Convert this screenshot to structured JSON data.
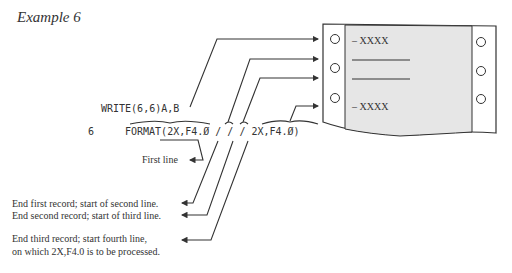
{
  "title": "Example 6",
  "code": {
    "write_stmt": "WRITE(6,6)A,B",
    "label": "6",
    "format_stmt": "FORMAT(2X,F4.Ø / / / 2X,F4.Ø)"
  },
  "paper": {
    "row1": "– XXXX",
    "row4": "– XXXX"
  },
  "annotations": {
    "first_line": "First line",
    "end_first": "End first record; start of second line.",
    "end_second": "End second record; start of third line.",
    "end_third_1": "End third record; start fourth line,",
    "end_third_2": "on which 2X,F4.0 is to be processed."
  },
  "colors": {
    "paper_gray": "#e6e6e6",
    "ink": "#333333"
  }
}
